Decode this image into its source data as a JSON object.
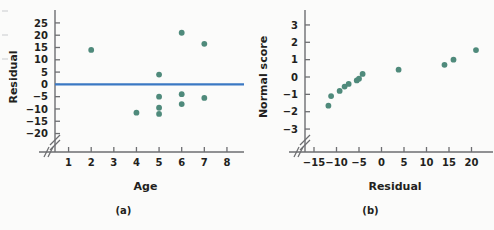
{
  "figure": {
    "background": "#fbfbfa",
    "marker_color": "#4f8a7b",
    "line_color": "#3b78c3",
    "axis_color": "#6d6e71",
    "text_color": "#231f20"
  },
  "panel_a": {
    "caption": "(a)",
    "chart_data": {
      "type": "scatter",
      "title": "",
      "xlabel": "Age",
      "ylabel": "Residual",
      "xlim": [
        0.4,
        8.4
      ],
      "ylim": [
        -21,
        27
      ],
      "xticks": [
        1,
        2,
        3,
        4,
        5,
        6,
        7,
        8
      ],
      "yticks": [
        25,
        20,
        15,
        10,
        5,
        0,
        -5,
        -10,
        -15,
        -20
      ],
      "xticklabels": [
        "1",
        "2",
        "3",
        "4",
        "5",
        "6",
        "7",
        "8"
      ],
      "yticklabels": [
        "25",
        "20",
        "15",
        "10",
        "5",
        "0",
        "−5",
        "−10",
        "−15",
        "−20"
      ],
      "grid": false,
      "legend": "none",
      "axis_break_x": true,
      "axis_break_y": true,
      "reference_line": {
        "orientation": "horizontal",
        "y": 0,
        "color": "#3b78c3"
      },
      "x": [
        2,
        4,
        5,
        5,
        5,
        5,
        6,
        6,
        6,
        7,
        7
      ],
      "y": [
        14,
        -11.5,
        4,
        -5,
        -9.5,
        -12,
        21,
        -4,
        -8,
        16.5,
        -5.5
      ],
      "points": [
        {
          "x": 2,
          "y": 14
        },
        {
          "x": 4,
          "y": -11.5
        },
        {
          "x": 5,
          "y": 4
        },
        {
          "x": 5,
          "y": -5
        },
        {
          "x": 5,
          "y": -9.5
        },
        {
          "x": 5,
          "y": -12
        },
        {
          "x": 6,
          "y": 21
        },
        {
          "x": 6,
          "y": -4
        },
        {
          "x": 6,
          "y": -8
        },
        {
          "x": 7,
          "y": 16.5
        },
        {
          "x": 7,
          "y": -5.5
        }
      ]
    }
  },
  "panel_b": {
    "caption": "(b)",
    "chart_data": {
      "type": "scatter",
      "title": "",
      "xlabel": "Residual",
      "ylabel": "Normal score",
      "xlim": [
        -17,
        23
      ],
      "ylim": [
        -3.4,
        3.4
      ],
      "xticks": [
        -15,
        -10,
        -5,
        0,
        5,
        10,
        15,
        20
      ],
      "yticks": [
        3,
        2,
        1,
        0,
        -1,
        -2,
        -3
      ],
      "xticklabels": [
        "−15",
        "−10",
        "−5",
        "0",
        "5",
        "10",
        "15",
        "20"
      ],
      "yticklabels": [
        "3",
        "2",
        "1",
        "0",
        "−1",
        "−2",
        "−3"
      ],
      "grid": false,
      "legend": "none",
      "axis_break_x": true,
      "axis_break_y": true,
      "x": [
        -11.8,
        -11.2,
        -9.3,
        -8.2,
        -7.3,
        -5.5,
        -5,
        -4.2,
        3.8,
        14,
        16,
        21
      ],
      "y": [
        -1.65,
        -1.1,
        -0.8,
        -0.55,
        -0.4,
        -0.2,
        -0.1,
        0.18,
        0.42,
        0.7,
        1.0,
        1.55
      ],
      "points": [
        {
          "x": -11.8,
          "y": -1.65
        },
        {
          "x": -11.2,
          "y": -1.1
        },
        {
          "x": -9.3,
          "y": -0.8
        },
        {
          "x": -8.2,
          "y": -0.55
        },
        {
          "x": -7.3,
          "y": -0.4
        },
        {
          "x": -5.5,
          "y": -0.2
        },
        {
          "x": -5.0,
          "y": -0.1
        },
        {
          "x": -4.2,
          "y": 0.18
        },
        {
          "x": 3.8,
          "y": 0.42
        },
        {
          "x": 14.0,
          "y": 0.7
        },
        {
          "x": 16.0,
          "y": 1.0
        },
        {
          "x": 21.0,
          "y": 1.55
        }
      ]
    }
  }
}
